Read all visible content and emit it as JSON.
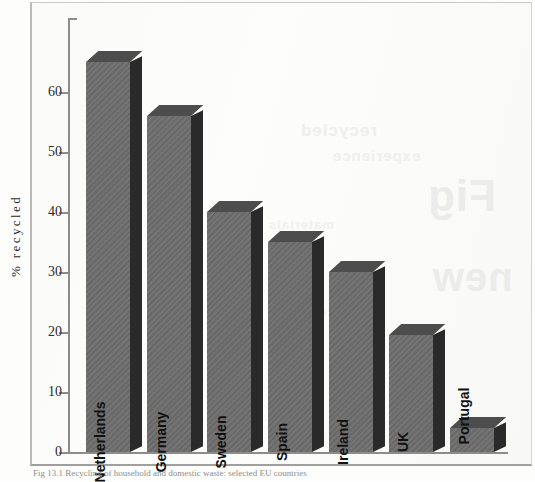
{
  "figure": {
    "caption": "Fig 13.1 Recycling of household and domestic waste: selected EU countries",
    "y_axis_title": "% recycled"
  },
  "chart_data": {
    "type": "bar",
    "title": "",
    "xlabel": "",
    "ylabel": "% recycled",
    "ylim": [
      0,
      70
    ],
    "yticks": [
      0,
      10,
      20,
      30,
      40,
      50,
      60
    ],
    "grid": false,
    "legend": "none",
    "categories": [
      "Netherlands",
      "Germany",
      "Sweden",
      "Spain",
      "Ireland",
      "UK",
      "Portugal"
    ],
    "values": [
      65,
      56,
      40,
      35,
      30,
      19.5,
      4
    ],
    "bar_style": "3d-block",
    "bar_face_color": "#6d6d6d",
    "bar_side_color": "#2a2a2a",
    "bar_top_color": "#4d4d4d"
  },
  "ticks": [
    {
      "value": "60"
    },
    {
      "value": "50"
    },
    {
      "value": "40"
    },
    {
      "value": "30"
    },
    {
      "value": "20"
    },
    {
      "value": "10"
    },
    {
      "value": "0"
    }
  ],
  "bars": [
    {
      "label": "Netherlands",
      "value": 65,
      "label_pos": "inside"
    },
    {
      "label": "Germany",
      "value": 56,
      "label_pos": "inside"
    },
    {
      "label": "Sweden",
      "value": 40,
      "label_pos": "inside"
    },
    {
      "label": "Spain",
      "value": 35,
      "label_pos": "inside"
    },
    {
      "label": "Ireland",
      "value": 30,
      "label_pos": "inside"
    },
    {
      "label": "UK",
      "value": 19.5,
      "label_pos": "inside"
    },
    {
      "label": "Portugal",
      "value": 4,
      "label_pos": "outside"
    }
  ],
  "ghost_text": [
    {
      "text": "recycled"
    },
    {
      "text": "experience"
    },
    {
      "text": "Fig"
    },
    {
      "text": "materials"
    },
    {
      "text": "new"
    },
    {
      "text": "process"
    }
  ]
}
